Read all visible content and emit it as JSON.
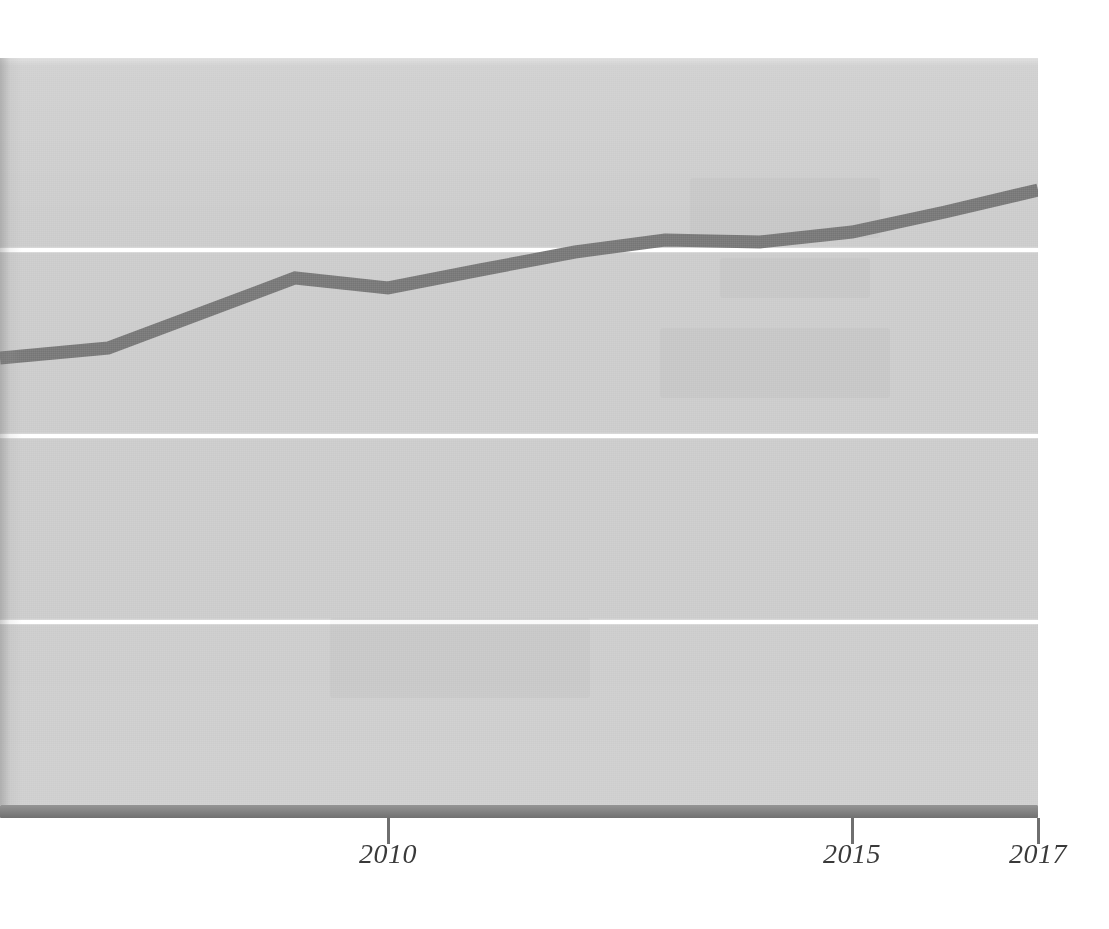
{
  "chart_data": {
    "type": "line",
    "title": "",
    "subtitle": "",
    "xlabel": "",
    "ylabel": "",
    "x": [
      2006,
      2007,
      2009,
      2010,
      2011,
      2012,
      2013,
      2014,
      2015,
      2016,
      2017
    ],
    "series": [
      {
        "name": "series-1",
        "values": [
          34.8,
          36.2,
          47.5,
          45.9,
          48.8,
          51.7,
          53.7,
          53.4,
          55.0,
          58.2,
          61.8
        ]
      }
    ],
    "x_tick_labels": [
      "2010",
      "2015",
      "2017"
    ],
    "x_tick_values": [
      2010,
      2015,
      2017
    ],
    "xlim": [
      2005.8,
      2017
    ],
    "ylim": [
      0,
      100
    ],
    "y_gridline_values": [
      60,
      40,
      20
    ],
    "grid": true,
    "grid_axis": "y",
    "y_axis_labels_visible": false,
    "legend": false,
    "legend_position": "none",
    "colors": {
      "line": "#7b7b7b",
      "plot_background": "#cdcdcd",
      "gridline": "#ffffff",
      "axis_bar": "#7d7d7d",
      "tick_label": "#3a3a3a",
      "page_background": "#ffffff"
    },
    "line_width_px": 13
  },
  "axis": {
    "ticks": [
      {
        "label": "2010",
        "x_px": 388
      },
      {
        "label": "2015",
        "x_px": 852
      },
      {
        "label": "2017",
        "x_px": 1038
      }
    ]
  },
  "plot": {
    "gridlines_y_px": [
      250,
      436,
      622
    ],
    "panel": {
      "left_px": 0,
      "top_px": 58,
      "width_px": 1038,
      "height_px": 747
    },
    "polyline_points_px": [
      [
        0,
        358
      ],
      [
        108,
        348
      ],
      [
        295,
        278
      ],
      [
        388,
        288
      ],
      [
        480,
        270
      ],
      [
        575,
        252
      ],
      [
        665,
        240
      ],
      [
        760,
        242
      ],
      [
        852,
        232
      ],
      [
        945,
        212
      ],
      [
        1038,
        190
      ]
    ]
  }
}
